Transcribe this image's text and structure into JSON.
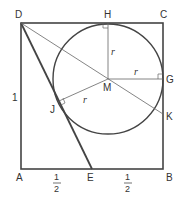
{
  "diagram": {
    "type": "geometry",
    "colors": {
      "stroke": "#444444",
      "thin_stroke": "#666666",
      "text": "#333333",
      "background": "#ffffff"
    },
    "points": {
      "A": {
        "label": "A",
        "x": 21,
        "y": 169
      },
      "B": {
        "label": "B",
        "x": 163,
        "y": 169
      },
      "C": {
        "label": "C",
        "x": 163,
        "y": 23
      },
      "D": {
        "label": "D",
        "x": 21,
        "y": 23
      },
      "E": {
        "label": "E",
        "x": 92,
        "y": 169
      },
      "H": {
        "label": "H",
        "x": 108,
        "y": 23
      },
      "G": {
        "label": "G",
        "x": 163,
        "y": 79
      },
      "M": {
        "label": "M",
        "x": 108,
        "y": 79
      },
      "J": {
        "label": "J",
        "x": 59,
        "y": 101
      },
      "K": {
        "label": "K",
        "x": 163,
        "y": 114
      }
    },
    "circle": {
      "center": "M",
      "radius_label": "r",
      "radius_px": 55
    },
    "labels": {
      "D": "D",
      "H": "H",
      "C": "C",
      "G": "G",
      "M": "M",
      "J": "J",
      "K": "K",
      "A": "A",
      "E": "E",
      "B": "B",
      "side_AD": "1",
      "r_MH": "r",
      "r_MG": "r",
      "r_MJ": "r",
      "half_AE_num": "1",
      "half_AE_den": "2",
      "half_EB_num": "1",
      "half_EB_den": "2"
    }
  }
}
